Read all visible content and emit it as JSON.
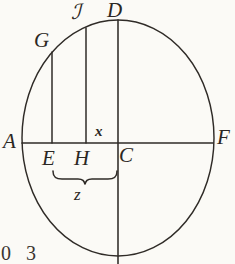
{
  "figure": {
    "kind": "geometric-diagram",
    "background_color": "#fbfaf6",
    "ink_color": "#2b2723",
    "ellipse": {
      "cx": 118,
      "cy": 138,
      "rx": 96,
      "ry": 118
    },
    "points": [
      {
        "id": "J",
        "label": "ℐ",
        "x": 86,
        "y": 20,
        "role": "top-of-chord-JH"
      },
      {
        "id": "D",
        "label": "D",
        "x": 118,
        "y": 20,
        "role": "top-of-vertical-diameter"
      },
      {
        "id": "G",
        "label": "G",
        "x": 52,
        "y": 52,
        "role": "top-of-chord-GE"
      },
      {
        "id": "A",
        "label": "A",
        "x": 22,
        "y": 143,
        "role": "left-end-of-diameter"
      },
      {
        "id": "E",
        "label": "E",
        "x": 52,
        "y": 143,
        "role": "foot-of-chord-GE"
      },
      {
        "id": "H",
        "label": "H",
        "x": 86,
        "y": 143,
        "role": "foot-of-chord-JH"
      },
      {
        "id": "C",
        "label": "C",
        "x": 118,
        "y": 143,
        "role": "center"
      },
      {
        "id": "F",
        "label": "F",
        "x": 213,
        "y": 143,
        "role": "right-end-of-diameter"
      }
    ],
    "segment_labels": [
      {
        "id": "x",
        "label": "x",
        "describes": "segment C to D (vertical radius)"
      },
      {
        "id": "z",
        "label": "z",
        "describes": "segment E to H (braced span on the horizontal diameter)"
      }
    ],
    "lines": {
      "horizontal_diameter": {
        "from": "A",
        "to": "F",
        "y": 143,
        "x1": 22,
        "x2": 213
      },
      "vertical_diameter": {
        "from": "D",
        "to": "bottom",
        "x": 118,
        "y1": 20,
        "y2": 264
      },
      "chord_GE": {
        "x": 52,
        "y1": 52,
        "y2": 143
      },
      "chord_JH": {
        "x": 86,
        "y1": 28,
        "y2": 143
      }
    },
    "brace": {
      "label": "z",
      "x1": 52,
      "x2": 118,
      "y": 174
    },
    "caption_fragment": "0 3"
  }
}
